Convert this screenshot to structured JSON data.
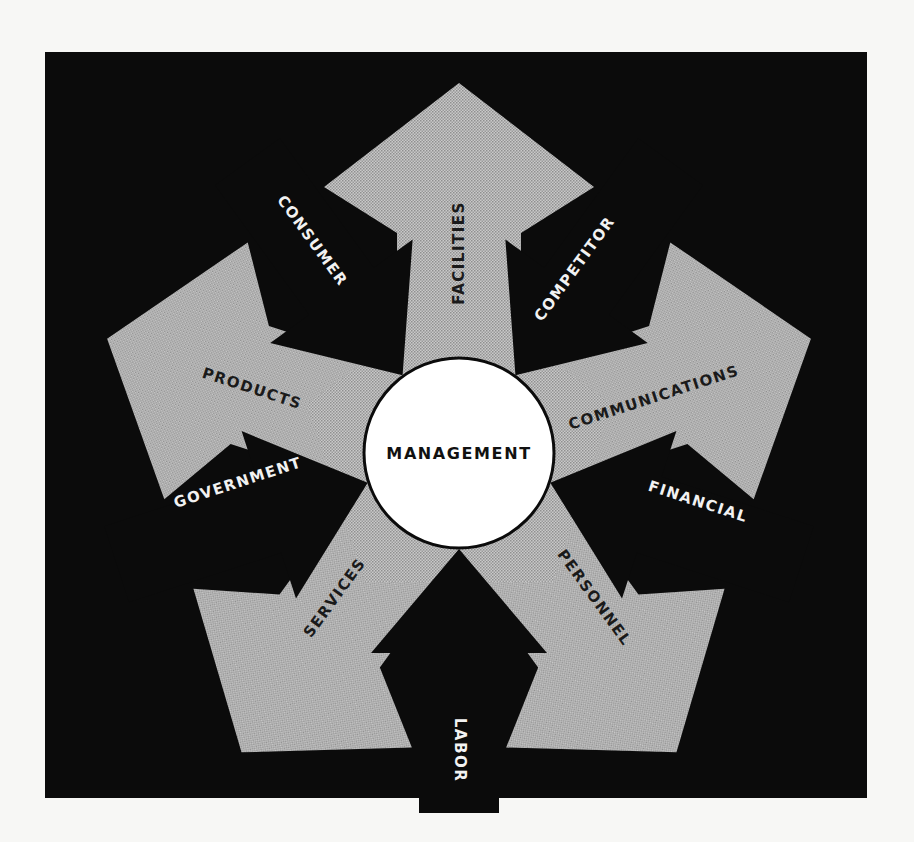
{
  "figure": {
    "background_color": "#f7f7f5",
    "frame_color": "#0b0b0b",
    "outward_arrow_color": "#b4b4b4",
    "inward_arrow_color": "#0b0b0b",
    "center_circle_color": "#ffffff",
    "center": {
      "label": "MANAGEMENT"
    },
    "outward_arrows": [
      {
        "label": "FACILITIES",
        "angle_deg": 0
      },
      {
        "label": "COMMUNICATIONS",
        "angle_deg": 72
      },
      {
        "label": "PERSONNEL",
        "angle_deg": 144
      },
      {
        "label": "SERVICES",
        "angle_deg": 216
      },
      {
        "label": "PRODUCTS",
        "angle_deg": 288
      }
    ],
    "inward_arrows": [
      {
        "label": "COMPETITOR",
        "angle_deg": 36
      },
      {
        "label": "FINANCIAL",
        "angle_deg": 108
      },
      {
        "label": "LABOR",
        "angle_deg": 180
      },
      {
        "label": "GOVERNMENT",
        "angle_deg": 252
      },
      {
        "label": "CONSUMER",
        "angle_deg": 324
      }
    ]
  }
}
